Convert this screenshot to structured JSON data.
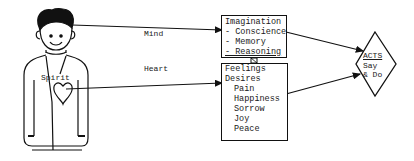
{
  "diagram": {
    "figure": {
      "label": "Spirit"
    },
    "connectors": {
      "mind_label": "Mind",
      "heart_label": "Heart"
    },
    "mind_box": {
      "title": "Imagination",
      "items": [
        "- Conscience",
        "- Memory",
        "- Reasoning"
      ]
    },
    "heart_box": {
      "items": [
        "Feelings",
        "Desires"
      ],
      "sub_items": [
        "Pain",
        "Happiness",
        "Sorrow",
        "Joy",
        "Peace"
      ]
    },
    "acts": {
      "title": "ACTS",
      "line1": "Say",
      "line2": "& Do"
    },
    "colors": {
      "ink": "#111111",
      "background": "#ffffff"
    }
  }
}
